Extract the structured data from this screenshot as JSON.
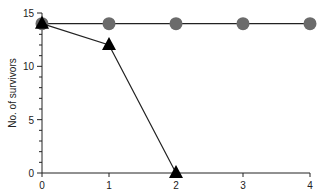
{
  "chart_data": {
    "type": "line",
    "title": "",
    "xlabel": "",
    "ylabel": "No. of survivors",
    "x": [
      0,
      1,
      2,
      3,
      4
    ],
    "xlim": [
      0,
      4
    ],
    "ylim": [
      0,
      15
    ],
    "xticks": [
      "0",
      "1",
      "2",
      "3",
      "4"
    ],
    "yticks": [
      "0",
      "5",
      "10",
      "15"
    ],
    "grid": false,
    "legend": null,
    "series": [
      {
        "name": "circles",
        "marker": "circle",
        "color": "#6b6b6b",
        "x": [
          0,
          1,
          2,
          3,
          4
        ],
        "values": [
          14,
          14,
          14,
          14,
          14
        ]
      },
      {
        "name": "triangles",
        "marker": "triangle",
        "color": "#000000",
        "x": [
          0,
          1,
          2
        ],
        "values": [
          14,
          12,
          0
        ]
      }
    ]
  }
}
